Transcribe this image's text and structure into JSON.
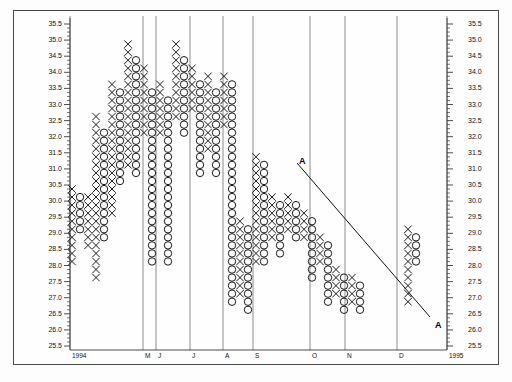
{
  "chart_data": {
    "type": "scatter",
    "chart_style": "point-and-figure",
    "title": "",
    "xlabel": "",
    "ylabel": "",
    "ylim": [
      25.5,
      35.5
    ],
    "y_ticks": [
      35.5,
      35.0,
      34.5,
      34.0,
      33.5,
      33.0,
      32.5,
      32.0,
      31.5,
      31.0,
      30.5,
      30.0,
      29.5,
      29.0,
      28.5,
      28.0,
      27.5,
      27.0,
      26.5,
      26.0,
      25.5
    ],
    "y_tick_labels": [
      "35.5",
      "35.0",
      "34.5",
      "34.0",
      "33.5",
      "33.0",
      "32.5",
      "32.0",
      "31.5",
      "31.0",
      "30.5",
      "30.0",
      "29.5",
      "29.0",
      "28.5",
      "28.0",
      "27.5",
      "27.0",
      "26.5",
      "26.0",
      "25.5"
    ],
    "left_axis": true,
    "right_axis": true,
    "grid": "vertical-only",
    "x_tick_labels": [
      "1994",
      "M",
      "J",
      "J",
      "A",
      "S",
      "O",
      "N",
      "D",
      "1995"
    ],
    "x_tick_px": [
      70,
      143,
      156,
      190,
      223,
      253,
      310,
      345,
      397,
      447
    ],
    "gridlines_px": [
      70,
      143,
      156,
      190,
      223,
      253,
      310,
      345,
      397,
      447
    ],
    "box_size": 0.25,
    "reversal": 3,
    "annotations": [
      {
        "label": "A",
        "x_px": 299,
        "y_px": 156,
        "role": "trendline-start-label"
      },
      {
        "label": "A",
        "x_px": 435,
        "y_px": 320,
        "role": "trendline-end-label"
      }
    ],
    "trendline": {
      "x1_px": 297,
      "y1_px": 163,
      "x2_px": 430,
      "y2_px": 317,
      "style": "solid",
      "color": "#111111",
      "direction": "down",
      "name": "bearish-resistance-line"
    },
    "legend": [],
    "columns": [
      {
        "index": 0,
        "type": "X",
        "x_px": 72,
        "low": 28.0,
        "high": 30.25
      },
      {
        "index": 1,
        "type": "O",
        "x_px": 80,
        "low": 29.0,
        "high": 30.0
      },
      {
        "index": 2,
        "type": "X",
        "x_px": 88,
        "low": 28.5,
        "high": 30.0
      },
      {
        "index": 3,
        "type": "X",
        "x_px": 96,
        "low": 27.5,
        "high": 32.5
      },
      {
        "index": 4,
        "type": "O",
        "x_px": 104,
        "low": 28.75,
        "high": 32.0
      },
      {
        "index": 5,
        "type": "X",
        "x_px": 112,
        "low": 29.5,
        "high": 33.5
      },
      {
        "index": 6,
        "type": "O",
        "x_px": 120,
        "low": 30.5,
        "high": 33.25
      },
      {
        "index": 7,
        "type": "X",
        "x_px": 128,
        "low": 31.0,
        "high": 34.75
      },
      {
        "index": 8,
        "type": "O",
        "x_px": 136,
        "low": 30.75,
        "high": 34.25
      },
      {
        "index": 9,
        "type": "X",
        "x_px": 144,
        "low": 32.0,
        "high": 34.0
      },
      {
        "index": 10,
        "type": "O",
        "x_px": 152,
        "low": 28.0,
        "high": 33.25
      },
      {
        "index": 11,
        "type": "X",
        "x_px": 160,
        "low": 32.0,
        "high": 33.5
      },
      {
        "index": 12,
        "type": "O",
        "x_px": 168,
        "low": 28.0,
        "high": 33.0
      },
      {
        "index": 13,
        "type": "X",
        "x_px": 176,
        "low": 32.5,
        "high": 34.75
      },
      {
        "index": 14,
        "type": "O",
        "x_px": 184,
        "low": 32.0,
        "high": 34.25
      },
      {
        "index": 15,
        "type": "X",
        "x_px": 192,
        "low": 32.75,
        "high": 34.0
      },
      {
        "index": 16,
        "type": "O",
        "x_px": 200,
        "low": 30.75,
        "high": 33.5
      },
      {
        "index": 17,
        "type": "X",
        "x_px": 208,
        "low": 31.5,
        "high": 33.75
      },
      {
        "index": 18,
        "type": "O",
        "x_px": 216,
        "low": 30.75,
        "high": 33.25
      },
      {
        "index": 19,
        "type": "X",
        "x_px": 224,
        "low": 32.25,
        "high": 33.75
      },
      {
        "index": 20,
        "type": "O",
        "x_px": 232,
        "low": 26.75,
        "high": 33.5
      },
      {
        "index": 21,
        "type": "X",
        "x_px": 240,
        "low": 27.0,
        "high": 29.25
      },
      {
        "index": 22,
        "type": "O",
        "x_px": 248,
        "low": 26.5,
        "high": 29.0
      },
      {
        "index": 23,
        "type": "X",
        "x_px": 256,
        "low": 28.0,
        "high": 31.25
      },
      {
        "index": 24,
        "type": "O",
        "x_px": 264,
        "low": 28.0,
        "high": 31.0
      },
      {
        "index": 25,
        "type": "X",
        "x_px": 272,
        "low": 28.75,
        "high": 30.0
      },
      {
        "index": 26,
        "type": "O",
        "x_px": 280,
        "low": 28.25,
        "high": 29.75
      },
      {
        "index": 27,
        "type": "X",
        "x_px": 288,
        "low": 29.0,
        "high": 30.0
      },
      {
        "index": 28,
        "type": "O",
        "x_px": 296,
        "low": 28.75,
        "high": 29.75
      },
      {
        "index": 29,
        "type": "X",
        "x_px": 304,
        "low": 28.75,
        "high": 29.5
      },
      {
        "index": 30,
        "type": "O",
        "x_px": 312,
        "low": 27.5,
        "high": 29.25
      },
      {
        "index": 31,
        "type": "X",
        "x_px": 320,
        "low": 28.0,
        "high": 28.75
      },
      {
        "index": 32,
        "type": "O",
        "x_px": 328,
        "low": 26.75,
        "high": 28.5
      },
      {
        "index": 33,
        "type": "X",
        "x_px": 336,
        "low": 27.0,
        "high": 27.75
      },
      {
        "index": 34,
        "type": "O",
        "x_px": 344,
        "low": 26.5,
        "high": 27.5
      },
      {
        "index": 35,
        "type": "X",
        "x_px": 352,
        "low": 26.75,
        "high": 27.5
      },
      {
        "index": 36,
        "type": "O",
        "x_px": 360,
        "low": 26.5,
        "high": 27.25
      },
      {
        "index": 37,
        "type": "X",
        "x_px": 408,
        "low": 26.75,
        "high": 29.0
      },
      {
        "index": 38,
        "type": "O",
        "x_px": 416,
        "low": 28.0,
        "high": 28.75
      }
    ]
  },
  "meta": {
    "left_axis_name": "price-scale-left",
    "right_axis_name": "price-scale-right",
    "plot_name": "point-and-figure-plot"
  }
}
